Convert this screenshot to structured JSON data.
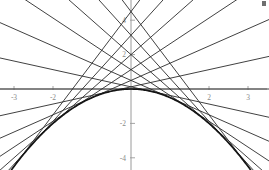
{
  "figure": {
    "title": "",
    "width": 269,
    "height": 170,
    "background_color": "#ffffff"
  },
  "axes": {
    "axis_color": "#9a9a9a",
    "x_axis_label": "",
    "y_axis_label": "",
    "x_tick_labels": [
      "-3",
      "-2",
      "2",
      "3"
    ],
    "x_tick_values": [
      -3,
      -2,
      2,
      3
    ],
    "y_tick_labels": [
      "4",
      "2",
      "-2",
      "-4"
    ],
    "y_tick_values": [
      4,
      2,
      -2,
      -4
    ],
    "origin_px": {
      "x": 131,
      "y": 89
    },
    "px_per_unit_x": 39,
    "px_per_unit_y": 17.2
  },
  "chart_data": {
    "type": "line",
    "title": "",
    "subtitle": "",
    "xlabel": "",
    "ylabel": "",
    "xlim": [
      -3.36,
      3.54
    ],
    "ylim": [
      -5.17,
      5.17
    ],
    "grid": false,
    "legend": null,
    "legend_position": "none",
    "annotations": [],
    "x_ticks": [
      -3,
      -2,
      2,
      3
    ],
    "y_ticks": [
      4,
      2,
      -2,
      -4
    ],
    "series": [
      {
        "name": "parabola y = -x^2/2",
        "kind": "curve",
        "color": "#151515",
        "linewidth": 1.7,
        "formula": "y = -0.5 * x^2",
        "x": [
          -3.3,
          -3.0,
          -2.5,
          -2.0,
          -1.5,
          -1.0,
          -0.5,
          0.0,
          0.5,
          1.0,
          1.5,
          2.0,
          2.5,
          3.0,
          3.3
        ],
        "values": [
          -5.445,
          -4.5,
          -3.125,
          -2.0,
          -1.125,
          -0.5,
          -0.125,
          0.0,
          -0.125,
          -0.5,
          -1.125,
          -2.0,
          -3.125,
          -4.5,
          -5.445
        ]
      },
      {
        "name": "tangent envelope family",
        "kind": "tangent-lines",
        "color": "#2b2b2b",
        "linewidth": 0.9,
        "formula": "y = -a*x + a^2/2",
        "count": 13,
        "tangent_points_a": [
          -3.0,
          -2.5,
          -2.0,
          -1.5,
          -1.0,
          -0.5,
          0.0,
          0.5,
          1.0,
          1.5,
          2.0,
          2.5,
          3.0
        ],
        "y_intercepts": [
          4.5,
          3.125,
          2.0,
          1.125,
          0.5,
          0.125,
          0.0,
          0.125,
          0.5,
          1.125,
          2.0,
          3.125,
          4.5
        ],
        "slopes": [
          3.0,
          2.5,
          2.0,
          1.5,
          1.0,
          0.5,
          0.0,
          -0.5,
          -1.0,
          -1.5,
          -2.0,
          -2.5,
          -3.0
        ]
      }
    ]
  }
}
